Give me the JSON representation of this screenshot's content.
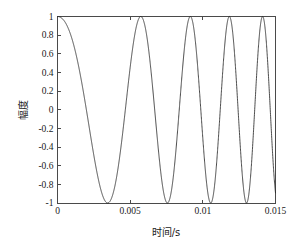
{
  "chart_data": {
    "type": "line",
    "title": "",
    "xlabel": "时间/s",
    "ylabel": "幅度",
    "xlim": [
      0,
      0.015
    ],
    "ylim": [
      -1,
      1
    ],
    "grid": false,
    "legend": null,
    "xticks": [
      0,
      0.005,
      0.01,
      0.015
    ],
    "xticklabels": [
      "0",
      "0.005",
      "0.01",
      "0.015"
    ],
    "yticks": [
      -1,
      -0.8,
      -0.6,
      -0.4,
      -0.2,
      0,
      0.2,
      0.4,
      0.6,
      0.8,
      1
    ],
    "yticklabels": [
      "-1",
      "-0.8",
      "-0.6",
      "-0.4",
      "-0.2",
      "0",
      "0.2",
      "0.4",
      "0.6",
      "0.8",
      "1"
    ],
    "series": [
      {
        "name": "chirp",
        "description": "Linear frequency-modulated chirp, cos(2*pi*(f0*t + 0.5*k*t^2)), f0 = 100 Hz, k = 26000 Hz/s, amplitude 1",
        "formula": "cos(2*pi*(100*t + 0.5*26000*t*t))",
        "f0_hz": 100,
        "chirp_rate_hz_per_s": 26000,
        "amplitude": 1,
        "t_start": 0,
        "t_end": 0.015,
        "n_samples": 2400,
        "peaks_t": [
          0,
          0.00445,
          0.00692,
          0.00884,
          0.0106,
          0.01226,
          0.01378,
          0.015
        ],
        "troughs_t": [
          0.00281,
          0.0058,
          0.00795,
          0.00975,
          0.01145,
          0.01303,
          0.0144
        ],
        "color": "#2b2b2b"
      }
    ]
  },
  "figure": {
    "background": "#ffffff",
    "axes_color": "#4a4a4a",
    "text_color": "#1a1a1a"
  }
}
